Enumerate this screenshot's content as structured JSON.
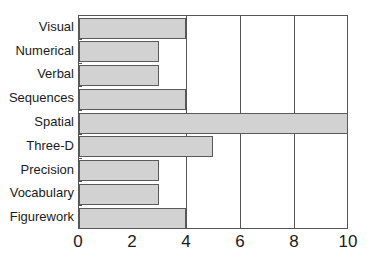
{
  "chart_data": {
    "type": "bar",
    "orientation": "horizontal",
    "title": "",
    "xlabel": "",
    "ylabel": "",
    "categories": [
      "Visual",
      "Numerical",
      "Verbal",
      "Sequences",
      "Spatial",
      "Three-D",
      "Precision",
      "Vocabulary",
      "Figurework"
    ],
    "values": [
      4,
      3,
      3,
      4,
      10,
      5,
      3,
      3,
      4
    ],
    "xlim": [
      0,
      10
    ],
    "xticks": [
      "0",
      "2",
      "4",
      "6",
      "8",
      "10"
    ],
    "grid": {
      "vertical": true,
      "at": [
        4,
        6,
        8
      ]
    },
    "legend": null,
    "bar_color": "#d2d2d2",
    "edge_color": "#5a5a5a"
  }
}
